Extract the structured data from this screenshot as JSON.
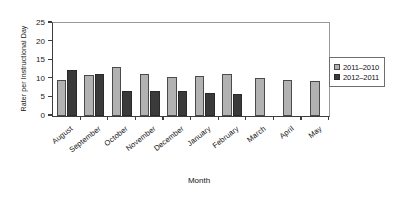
{
  "chart_data": {
    "type": "bar",
    "title": "",
    "xlabel": "Month",
    "ylabel": "Rater per Instructional Day",
    "categories": [
      "August",
      "September",
      "October",
      "November",
      "December",
      "January",
      "February",
      "March",
      "April",
      "May"
    ],
    "series": [
      {
        "name": "2011–2010",
        "color": "#b2b2b2",
        "values": [
          9.8,
          11.1,
          13.1,
          11.3,
          10.6,
          10.8,
          11.3,
          10.1,
          9.7,
          9.3
        ]
      },
      {
        "name": "2012–2011",
        "color": "#3a3a3a",
        "values": [
          12.4,
          11.4,
          6.8,
          6.8,
          6.6,
          6.2,
          6.0,
          null,
          null,
          null
        ]
      }
    ],
    "ylim": [
      0,
      25
    ],
    "yticks": [
      0,
      5,
      10,
      15,
      20,
      25
    ],
    "ytick_labels": [
      "0",
      "5",
      "10",
      "15",
      "20",
      "25"
    ],
    "grid": false,
    "legend_position": "right"
  },
  "legend": {
    "entries": [
      {
        "label": "2011–2010"
      },
      {
        "label": "2012–2011"
      }
    ]
  },
  "axes": {
    "x_title": "Month",
    "y_title": "Rater per Instructional Day"
  }
}
